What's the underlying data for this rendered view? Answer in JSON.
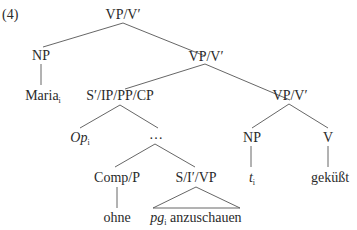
{
  "example_number": "(4)",
  "nodes": {
    "root": "VP/V′",
    "np1": "NP",
    "maria": "Maria",
    "maria_idx": "i",
    "vp2": "VP/V′",
    "s_cp": "S′/IP/PP/CP",
    "vp3": "VP/V′",
    "op": "Op",
    "op_idx": "i",
    "dots": "…",
    "np2": "NP",
    "v": "V",
    "trace": "t",
    "trace_idx": "i",
    "gekusst": "geküßt",
    "comp": "Comp/P",
    "s_vp": "S/I′/VP",
    "ohne": "ohne",
    "pg": "pg",
    "pg_idx": "i",
    "anzuschauen": " anzuschauen"
  }
}
